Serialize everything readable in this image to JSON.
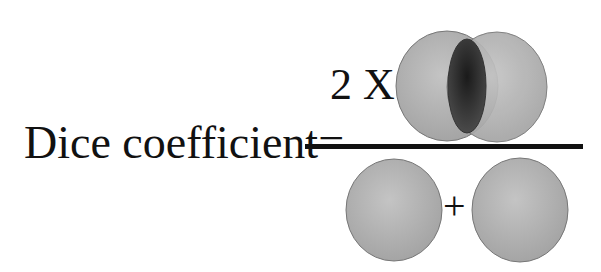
{
  "formula": {
    "label": "Dice coefficient=",
    "numerator_multiplier": "2 X",
    "denominator_operator": "+"
  },
  "shapes": {
    "numerator": {
      "description": "Two overlapping circles (sets A and B) with intersection highlighted",
      "circle_fill": "#b0b0b0",
      "intersection_fill": "#2e2e2e"
    },
    "denominator": {
      "description": "Two separate circles (set A plus set B)",
      "circle_fill": "#a8a8a8"
    }
  },
  "colors": {
    "text": "#111111",
    "line": "#111111",
    "background": "#ffffff"
  }
}
